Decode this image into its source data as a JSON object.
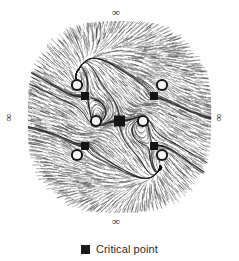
{
  "figure": {
    "background_color": "#ffffff",
    "width": 239,
    "height": 261
  },
  "labels": {
    "infinity_top": "∞",
    "infinity_bottom": "∞",
    "infinity_left": "∞",
    "infinity_right": "∞"
  },
  "legend": {
    "marker_icon": "filled-square-icon",
    "marker_color": "#1c1c1c",
    "label": "Critical point"
  },
  "chart_data": {
    "type": "scatter",
    "xlabel": "",
    "ylabel": "",
    "xlim": [
      -1,
      1
    ],
    "ylim": [
      -1,
      1
    ],
    "grid": false,
    "legend_position": "bottom-center",
    "annotations": [
      "∞",
      "∞",
      "∞",
      "∞"
    ],
    "render_style": "line-integral-convolution-streamlets",
    "streamlet_color": "#303030",
    "domain_shape": "rounded-square",
    "domain_center": [
      119.5,
      117
    ],
    "domain_radius_x": 92,
    "domain_radius_y": 96,
    "series": [
      {
        "name": "Saddle points",
        "marker": "square",
        "color": "#141414",
        "points": [
          {
            "x": 119.5,
            "y": 121,
            "type": "saddle",
            "size": 11
          },
          {
            "x": 85,
            "y": 96,
            "type": "saddle",
            "size": 8
          },
          {
            "x": 154,
            "y": 96,
            "type": "saddle",
            "size": 8
          },
          {
            "x": 85,
            "y": 146,
            "type": "saddle",
            "size": 8
          },
          {
            "x": 154,
            "y": 146,
            "type": "saddle",
            "size": 8
          }
        ]
      },
      {
        "name": "Centers",
        "marker": "circle",
        "color": "#f2f2f2",
        "edge_color": "#1a1a1a",
        "points": [
          {
            "x": 96,
            "y": 121,
            "type": "center",
            "size": 9
          },
          {
            "x": 143,
            "y": 121,
            "type": "center",
            "size": 9
          },
          {
            "x": 77,
            "y": 85,
            "type": "center",
            "size": 9
          },
          {
            "x": 162,
            "y": 85,
            "type": "center",
            "size": 9
          },
          {
            "x": 77,
            "y": 155,
            "type": "center",
            "size": 9
          },
          {
            "x": 162,
            "y": 155,
            "type": "center",
            "size": 9
          }
        ]
      }
    ],
    "critical_point_count": 11,
    "symmetry": "four-fold mirror (horizontal and vertical axes)"
  }
}
